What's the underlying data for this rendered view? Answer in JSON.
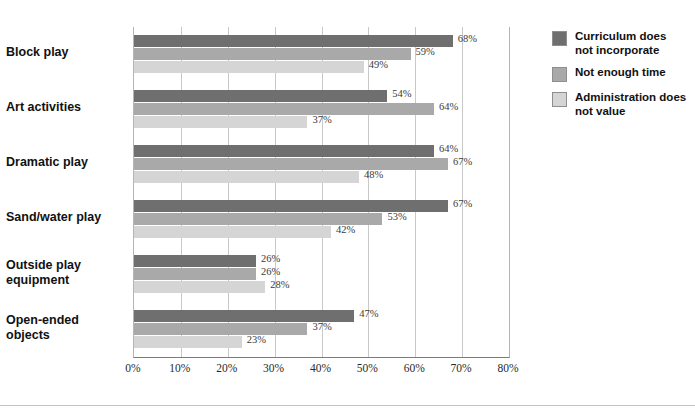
{
  "chart_data": {
    "type": "bar",
    "orientation": "horizontal",
    "title": "",
    "xlabel": "",
    "ylabel": "",
    "xlim": [
      0,
      80
    ],
    "xticks": [
      "0%",
      "10%",
      "20%",
      "30%",
      "40%",
      "50%",
      "60%",
      "70%",
      "80%"
    ],
    "xtick_values": [
      0,
      10,
      20,
      30,
      40,
      50,
      60,
      70,
      80
    ],
    "grid": "vertical",
    "legend_position": "right",
    "categories": [
      "Block play",
      "Art activities",
      "Dramatic play",
      "Sand/water play",
      "Outside play equipment",
      "Open-ended objects"
    ],
    "series": [
      {
        "name": "Curriculum does not incorporate",
        "color": "#6f6f6f",
        "values": [
          68,
          54,
          64,
          67,
          26,
          47
        ],
        "labels": [
          "68%",
          "54%",
          "64%",
          "67%",
          "26%",
          "47%"
        ]
      },
      {
        "name": "Not enough time",
        "color": "#a9a9a9",
        "values": [
          59,
          64,
          67,
          53,
          26,
          37
        ],
        "labels": [
          "59%",
          "64%",
          "67%",
          "53%",
          "26%",
          "37%"
        ]
      },
      {
        "name": "Administration does not value",
        "color": "#d5d5d5",
        "values": [
          49,
          37,
          48,
          42,
          28,
          23
        ],
        "labels": [
          "49%",
          "37%",
          "48%",
          "42%",
          "28%",
          "23%"
        ]
      }
    ]
  },
  "legend": {
    "items": [
      {
        "label": "Curriculum does not incorporate",
        "color": "#6f6f6f"
      },
      {
        "label": "Not enough time",
        "color": "#a9a9a9"
      },
      {
        "label": "Administration does not value",
        "color": "#d5d5d5"
      }
    ]
  }
}
